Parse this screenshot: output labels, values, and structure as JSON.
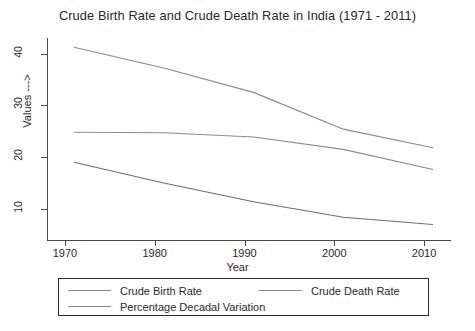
{
  "chart_data": {
    "type": "line",
    "title": "Crude Birth Rate and Crude Death Rate in India (1971 - 2011)",
    "xlabel": "Year",
    "ylabel": "Values --->",
    "xlim": [
      1968,
      2013
    ],
    "ylim": [
      4,
      43
    ],
    "grid": false,
    "legend_position": "below-plot",
    "xticks": [
      "1970",
      "1980",
      "1990",
      "2000",
      "2010"
    ],
    "xtick_values": [
      1970,
      1980,
      1990,
      2000,
      2010
    ],
    "yticks": [
      "10",
      "20",
      "30",
      "40"
    ],
    "ytick_values": [
      10,
      20,
      30,
      40
    ],
    "x": [
      1971,
      1981,
      1991,
      2001,
      2011
    ],
    "series": [
      {
        "name": "Crude Birth Rate",
        "color": "#8c8c8c",
        "values": [
          41.2,
          37.2,
          32.5,
          25.4,
          21.8
        ]
      },
      {
        "name": "Crude Death Rate",
        "color": "#6e6e6e",
        "values": [
          19.0,
          15.0,
          11.4,
          8.4,
          7.0
        ]
      },
      {
        "name": "Percentage Decadal Variation",
        "color": "#8c8c8c",
        "values": [
          24.8,
          24.7,
          23.9,
          21.5,
          17.6
        ]
      }
    ]
  },
  "legend": {
    "entries": [
      {
        "label": "Crude Birth Rate"
      },
      {
        "label": "Crude Death Rate"
      },
      {
        "label": "Percentage Decadal Variation"
      }
    ]
  }
}
